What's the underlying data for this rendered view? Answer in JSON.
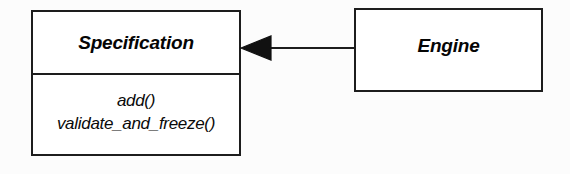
{
  "diagram": {
    "type": "uml-class-diagram",
    "background_color": "#fcfcfc",
    "line_color": "#1d1d1d",
    "classes": [
      {
        "id": "specification",
        "name": "Specification",
        "abstract": true,
        "members": [
          "add()",
          "validate_and_freeze()"
        ]
      },
      {
        "id": "engine",
        "name": "Engine",
        "abstract": true,
        "members": []
      }
    ],
    "relationships": [
      {
        "id": "engine-to-specification",
        "type": "generalization",
        "arrow": "solid-filled-triangle",
        "from": "Engine",
        "to": "Specification",
        "label": ""
      }
    ]
  }
}
